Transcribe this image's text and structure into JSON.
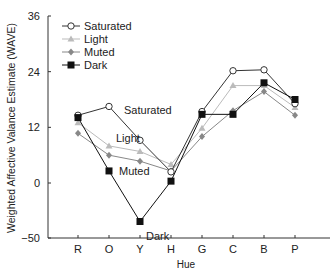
{
  "chart_data": {
    "type": "line",
    "title": "",
    "xlabel": "Hue",
    "ylabel": "Weighted Affective Valance Estimate (WAVE)",
    "categories": [
      "R",
      "O",
      "Y",
      "H",
      "G",
      "C",
      "B",
      "P"
    ],
    "yticks": [
      -50,
      0,
      12,
      24,
      36
    ],
    "ylim": [
      -50,
      36
    ],
    "grid": false,
    "legend_position": "upper left",
    "series": [
      {
        "name": "Saturated",
        "marker": "open-circle",
        "color": "#333333",
        "values": [
          14.6,
          16.5,
          9.2,
          2.4,
          15.4,
          24.2,
          24.4,
          17.1
        ]
      },
      {
        "name": "Light",
        "marker": "triangle",
        "color": "#bbbbbb",
        "values": [
          13.0,
          8.0,
          6.8,
          4.0,
          11.8,
          21.0,
          21.0,
          16.3
        ]
      },
      {
        "name": "Muted",
        "marker": "diamond",
        "color": "#888888",
        "values": [
          10.7,
          6.0,
          4.7,
          2.6,
          10.0,
          15.6,
          19.7,
          14.6
        ]
      },
      {
        "name": "Dark",
        "marker": "filled-square",
        "color": "#111111",
        "values": [
          14.1,
          2.6,
          -35.0,
          0.4,
          14.8,
          14.8,
          21.6,
          18.0
        ]
      }
    ],
    "annotations": [
      {
        "text": "Saturated",
        "near": "O"
      },
      {
        "text": "Light",
        "near": "O"
      },
      {
        "text": "Muted",
        "near": "O"
      },
      {
        "text": "Dark",
        "near": "Y"
      }
    ]
  }
}
